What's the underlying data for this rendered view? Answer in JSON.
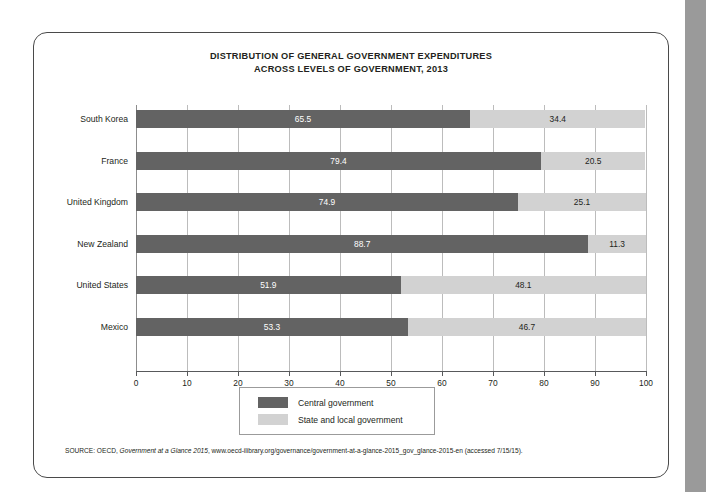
{
  "chart_data": {
    "type": "bar",
    "orientation": "horizontal",
    "stacked": true,
    "title": "DISTRIBUTION OF GENERAL GOVERNMENT EXPENDITURES",
    "subtitle": "ACROSS LEVELS OF GOVERNMENT, 2013",
    "xlabel": "",
    "ylabel": "",
    "xlim": [
      0,
      100
    ],
    "xticks": [
      0,
      10,
      20,
      30,
      40,
      50,
      60,
      70,
      80,
      90,
      100
    ],
    "grid": true,
    "legend_position": "bottom-center",
    "categories": [
      "South Korea",
      "France",
      "United Kingdom",
      "New Zealand",
      "United States",
      "Mexico"
    ],
    "series": [
      {
        "name": "Central government",
        "color": "#636363",
        "values": [
          65.5,
          79.4,
          74.9,
          88.7,
          51.9,
          53.3
        ],
        "labels": [
          "65.5",
          "79.4",
          "74.9",
          "88.7",
          "51.9",
          "53.3"
        ]
      },
      {
        "name": "State and local government",
        "color": "#d2d2d2",
        "values": [
          34.4,
          20.5,
          25.1,
          11.3,
          48.1,
          46.7
        ],
        "labels": [
          "34.4",
          "20.5",
          "25.1",
          "11.3",
          "48.1",
          "46.7"
        ]
      }
    ]
  },
  "legend": {
    "items": [
      {
        "label": "Central government",
        "color": "#636363"
      },
      {
        "label": "State and local government",
        "color": "#d2d2d2"
      }
    ]
  },
  "source": {
    "prefix": "SOURCE: OECD, ",
    "italic": "Government at a Glance 2015",
    "suffix": ", www.oecd-ilibrary.org/governance/government-at-a-glance-2015_gov_glance-2015-en (accessed 7/15/15)."
  },
  "colors": {
    "central": "#636363",
    "state_local": "#d2d2d2",
    "gridline": "#bcbcbc",
    "axis": "#58595b",
    "card_border": "#4a4a4a",
    "gutter": "#9a9a9a",
    "text": "#231f20"
  }
}
